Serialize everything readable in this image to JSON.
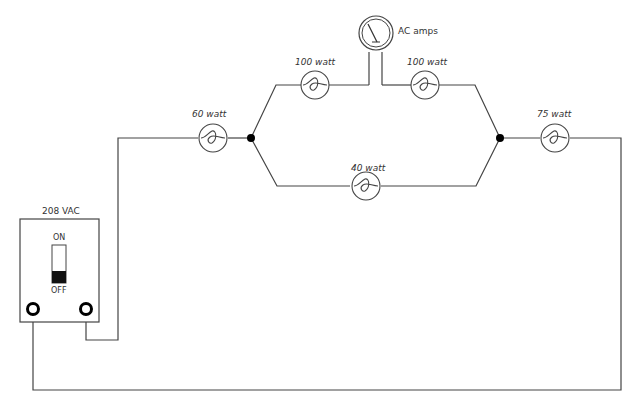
{
  "diagram": {
    "source": {
      "label": "208 VAC",
      "switch_on": "ON",
      "switch_off": "OFF",
      "state": "OFF"
    },
    "meter": {
      "label": "AC amps"
    },
    "lamps": [
      {
        "id": "lamp-60",
        "label": "60 watt"
      },
      {
        "id": "lamp-100-left",
        "label": "100 watt"
      },
      {
        "id": "lamp-100-right",
        "label": "100 watt"
      },
      {
        "id": "lamp-40",
        "label": "40 watt"
      },
      {
        "id": "lamp-75",
        "label": "75 watt"
      }
    ],
    "colors": {
      "wire": "#444444",
      "node": "#000000",
      "switch_lever": "#111111"
    }
  }
}
